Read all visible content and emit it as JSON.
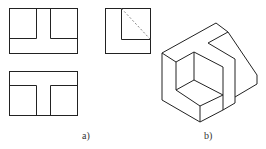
{
  "figure": {
    "labels": {
      "a": "a)",
      "b": "b)"
    },
    "stroke_color": "#222222",
    "hidden_line_color": "#888888",
    "views": {
      "front": "front view with T-shaped slot",
      "top": "top view",
      "side": "side view with dashed hidden line",
      "isometric": "isometric view of block with L-shaped cut and stepped notch"
    }
  }
}
